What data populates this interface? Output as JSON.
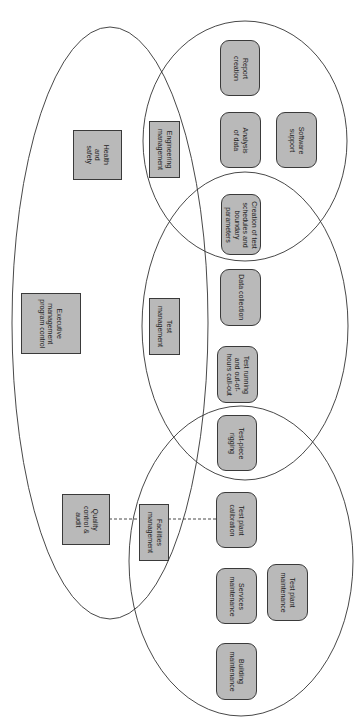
{
  "diagram": {
    "orientation": "rotated 90deg clockwise",
    "colors": {
      "background": "#ffffff",
      "node_fill": "#b9b9b9",
      "node_border": "#3a3a3a",
      "ellipse_stroke": "#333333",
      "connector": "#333333"
    },
    "groups": [
      {
        "id": "executive",
        "shape": "ellipse",
        "label_node": "executive_management"
      },
      {
        "id": "engineering",
        "shape": "ellipse",
        "label_node": "engineering_management"
      },
      {
        "id": "test",
        "shape": "ellipse",
        "label_node": "test_management"
      },
      {
        "id": "facilities",
        "shape": "ellipse",
        "label_node": "facilities_management"
      }
    ],
    "nodes": {
      "health_safety": {
        "label": "Health\nand\nsafety",
        "shape": "square"
      },
      "executive_management": {
        "label": "Executive\nmanagement\nprogram control",
        "shape": "square"
      },
      "quality_control": {
        "label": "Quality\ncontrol &\naudit",
        "shape": "square"
      },
      "engineering_management": {
        "label": "Engineering\nmanagement",
        "shape": "square"
      },
      "test_management": {
        "label": "Test\nmanagement",
        "shape": "square"
      },
      "facilities_management": {
        "label": "Facilities\nmanagement",
        "shape": "square"
      },
      "report_creation": {
        "label": "Report\ncreation",
        "shape": "rounded"
      },
      "analysis_of_data": {
        "label": "Analysis\nof data",
        "shape": "rounded"
      },
      "software_support": {
        "label": "Software\nsupport",
        "shape": "rounded"
      },
      "creation_of_test_schedules": {
        "label": "Creation of test\nschedules and\nboundary\nparameters",
        "shape": "rounded"
      },
      "data_collection": {
        "label": "Data collection",
        "shape": "rounded"
      },
      "test_running": {
        "label": "Test running\nand out-of-\nhours call-out",
        "shape": "rounded"
      },
      "test_piece_rigging": {
        "label": "Test-piece\nrigging",
        "shape": "rounded"
      },
      "test_plant_calibration": {
        "label": "Test plant\ncalibration",
        "shape": "rounded"
      },
      "services_maintenance": {
        "label": "Services\nmaintenance",
        "shape": "rounded"
      },
      "test_plant_maintenance": {
        "label": "Test plant\nmaintenance",
        "shape": "rounded"
      },
      "building_maintenance": {
        "label": "Building\nmaintenance",
        "shape": "rounded"
      }
    },
    "connectors": [
      {
        "from": "quality_control",
        "via": "facilities_management",
        "to": "test_plant_calibration",
        "style": "dashed"
      }
    ]
  }
}
